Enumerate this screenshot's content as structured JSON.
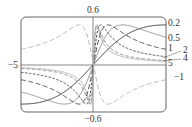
{
  "chart_data": {
    "type": "line",
    "title": "",
    "function": "f(x) = c*x / (1 + c^2 x^2)",
    "xlabel": "",
    "ylabel": "",
    "xlim": [
      -5,
      5
    ],
    "ylim": [
      -0.6,
      0.6
    ],
    "grid": false,
    "tick_labels": {
      "x_left": "−5",
      "x_right": "5",
      "y_top": "0.6",
      "y_bottom": "−0.6"
    },
    "series": [
      {
        "name": "0.2",
        "c": 0.2,
        "style": "solid",
        "color": "#222222"
      },
      {
        "name": "0.5",
        "c": 0.5,
        "style": "solid",
        "color": "#888888"
      },
      {
        "name": "1",
        "c": 1,
        "style": "longdash",
        "color": "#333333"
      },
      {
        "name": "2",
        "c": 2,
        "style": "shortdash",
        "color": "#333333"
      },
      {
        "name": "4",
        "c": 4,
        "style": "dash",
        "color": "#777777"
      },
      {
        "name": "5",
        "c": 5,
        "style": "solid",
        "color": "#aaaaaa"
      },
      {
        "name": "−1",
        "c": -1,
        "style": "longdash",
        "color": "#aaaaaa"
      }
    ],
    "legend_position": "right, curve labels"
  }
}
